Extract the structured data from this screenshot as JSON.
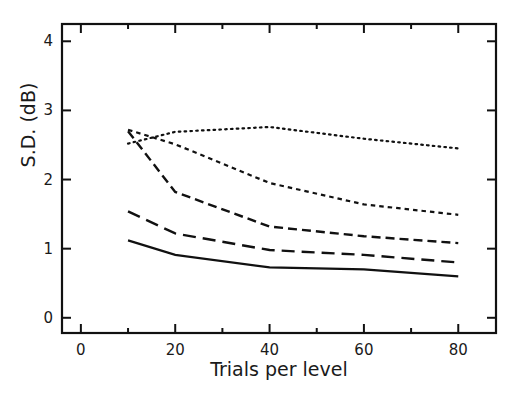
{
  "chart_data": {
    "type": "line",
    "title": "",
    "xlabel": "Trials per level",
    "ylabel": "S.D.  (dB)",
    "xlim": [
      -4,
      88
    ],
    "ylim": [
      -0.22,
      4.25
    ],
    "x_ticks_major": [
      0,
      20,
      40,
      60,
      80
    ],
    "x_ticks_major_labels": [
      "0",
      "20",
      "40",
      "60",
      "80"
    ],
    "x_ticks_minor": [
      10,
      30,
      50,
      70
    ],
    "y_ticks_major": [
      0,
      1,
      2,
      3,
      4
    ],
    "y_ticks_major_labels": [
      "0",
      "1",
      "2",
      "3",
      "4"
    ],
    "grid": false,
    "legend": "none",
    "box_frame": true,
    "tick_direction": "in",
    "x": [
      10,
      20,
      40,
      60,
      80
    ],
    "series": [
      {
        "name": "dotted",
        "linestyle": "dotted",
        "color": "#111111",
        "values": [
          2.52,
          2.69,
          2.76,
          2.59,
          2.45
        ]
      },
      {
        "name": "short-dash",
        "linestyle": "short-dash",
        "color": "#111111",
        "values": [
          2.72,
          2.51,
          1.95,
          1.64,
          1.49
        ]
      },
      {
        "name": "medium-dash",
        "linestyle": "medium-dash",
        "color": "#111111",
        "values": [
          2.7,
          1.82,
          1.32,
          1.18,
          1.08
        ]
      },
      {
        "name": "long-dash",
        "linestyle": "long-dash",
        "color": "#111111",
        "values": [
          1.54,
          1.22,
          0.98,
          0.91,
          0.8
        ]
      },
      {
        "name": "solid",
        "linestyle": "solid",
        "color": "#111111",
        "values": [
          1.12,
          0.91,
          0.73,
          0.7,
          0.6
        ]
      }
    ]
  }
}
